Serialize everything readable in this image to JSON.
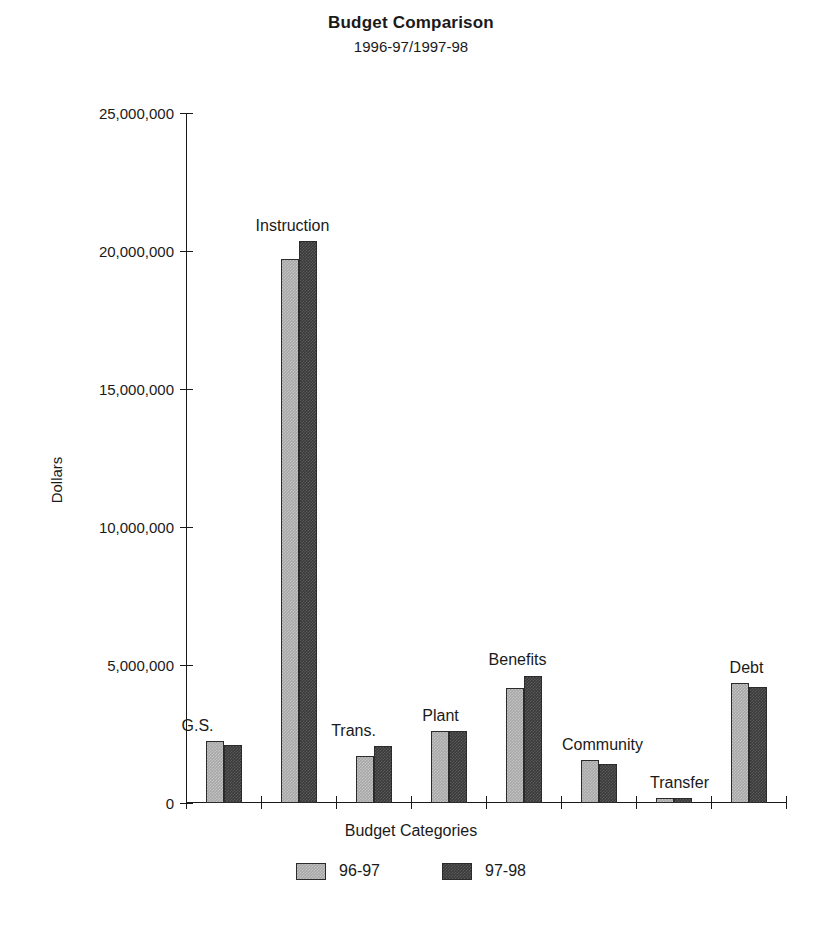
{
  "chart_data": {
    "type": "bar",
    "title": "Budget Comparison",
    "subtitle": "1996-97/1997-98",
    "xlabel": "Budget Categories",
    "ylabel": "Dollars",
    "ylim": [
      0,
      25000000
    ],
    "yticks": [
      0,
      5000000,
      10000000,
      15000000,
      20000000,
      25000000
    ],
    "ytick_labels": [
      "0",
      "5,000,000",
      "10,000,000",
      "15,000,000",
      "20,000,000",
      "25,000,000"
    ],
    "grid": false,
    "legend_position": "bottom",
    "categories": [
      "G.S.",
      "Instruction",
      "Trans.",
      "Plant",
      "Benefits",
      "Community",
      "Transfer",
      "Debt"
    ],
    "series": [
      {
        "name": "96-97",
        "color": "#a8a8a8",
        "values": [
          2250000,
          19700000,
          1700000,
          2600000,
          4150000,
          1560000,
          180000,
          4350000
        ]
      },
      {
        "name": "97-98",
        "color": "#3a3a3a",
        "values": [
          2100000,
          20350000,
          2050000,
          2600000,
          4620000,
          1410000,
          170000,
          4200000
        ]
      }
    ]
  },
  "legend": {
    "items": [
      {
        "label": "96-97"
      },
      {
        "label": "97-98"
      }
    ]
  }
}
